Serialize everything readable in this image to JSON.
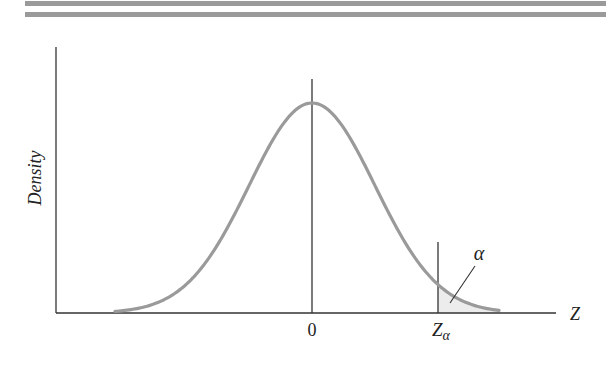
{
  "figure": {
    "ylabel": "Density",
    "xlabel": "Z",
    "tick_zero": "0",
    "tick_z_main": "Z",
    "tick_z_sub": "α",
    "alpha_label": "α",
    "colors": {
      "curve": "#9a9a9a",
      "axes": "#333333",
      "shade": "#ececec",
      "rules": "#9a9a9a"
    }
  },
  "chart_data": {
    "type": "area",
    "title": "",
    "xlabel": "Z",
    "ylabel": "Density",
    "distribution": "standard normal",
    "x_ticks": [
      "0",
      "Zα"
    ],
    "annotations": [
      {
        "text": "α",
        "target": "right-tail area beyond Zα (shaded)"
      }
    ],
    "shaded_region": {
      "from": "Zα",
      "to": "+inf"
    },
    "approx_z_alpha": 2.0,
    "grid": false,
    "legend": null
  }
}
